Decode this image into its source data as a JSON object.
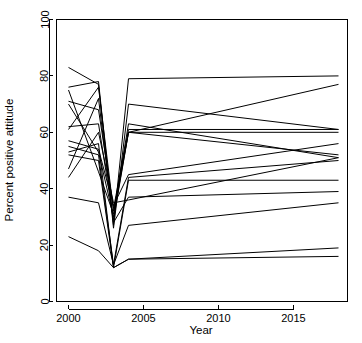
{
  "chart_data": {
    "type": "line",
    "title": "",
    "subtitle": "",
    "xlabel": "Year",
    "ylabel": "Percent positive attitude",
    "xlim": [
      1999.2,
      2018.6
    ],
    "ylim": [
      0,
      100
    ],
    "grid": false,
    "legend": false,
    "legend_position": "none",
    "line_color": "#000000",
    "background_color": "#ffffff",
    "xticks": [
      2000,
      2005,
      2010,
      2015
    ],
    "xtick_labels": [
      "2000",
      "2005",
      "2010",
      "2015"
    ],
    "yticks": [
      0,
      20,
      40,
      60,
      80,
      100
    ],
    "ytick_labels": [
      "0",
      "20",
      "40",
      "60",
      "80",
      "100"
    ],
    "x": [
      2000,
      2002,
      2003,
      2004,
      2018
    ],
    "series": [
      {
        "name": "series-1",
        "x": [
          2000,
          2002,
          2003,
          2004,
          2018
        ],
        "values": [
          83,
          77,
          26,
          70,
          61
        ]
      },
      {
        "name": "series-2",
        "x": [
          2000,
          2002,
          2003,
          2004,
          2018
        ],
        "values": [
          76,
          78,
          27,
          79,
          80
        ]
      },
      {
        "name": "series-3",
        "x": [
          2000,
          2002,
          2003,
          2004,
          2018
        ],
        "values": [
          75,
          46,
          31,
          63,
          51
        ]
      },
      {
        "name": "series-4",
        "x": [
          2000,
          2002,
          2003,
          2004,
          2018
        ],
        "values": [
          71,
          68,
          33,
          61,
          61
        ]
      },
      {
        "name": "series-5",
        "x": [
          2000,
          2002,
          2003,
          2004,
          2018
        ],
        "values": [
          70,
          53,
          30,
          60,
          60
        ]
      },
      {
        "name": "series-6",
        "x": [
          2000,
          2002,
          2003,
          2004,
          2018
        ],
        "values": [
          62,
          63,
          29,
          60,
          77
        ]
      },
      {
        "name": "series-7",
        "x": [
          2000,
          2002,
          2003,
          2004,
          2018
        ],
        "values": [
          61,
          76,
          32,
          60,
          52
        ]
      },
      {
        "name": "series-8",
        "x": [
          2000,
          2002,
          2003,
          2004,
          2018
        ],
        "values": [
          57,
          54,
          34,
          45,
          56
        ]
      },
      {
        "name": "series-9",
        "x": [
          2000,
          2002,
          2003,
          2004,
          2018
        ],
        "values": [
          55,
          52,
          13,
          44,
          50
        ]
      },
      {
        "name": "series-10",
        "x": [
          2000,
          2002,
          2003,
          2004,
          2018
        ],
        "values": [
          53,
          56,
          12,
          43,
          43
        ]
      },
      {
        "name": "series-11",
        "x": [
          2000,
          2002,
          2003,
          2004,
          2018
        ],
        "values": [
          47,
          72,
          28,
          37,
          39
        ]
      },
      {
        "name": "series-12",
        "x": [
          2000,
          2002,
          2003,
          2004,
          2018
        ],
        "values": [
          44,
          60,
          35,
          36,
          51
        ]
      },
      {
        "name": "series-13",
        "x": [
          2000,
          2002,
          2003,
          2004,
          2018
        ],
        "values": [
          37,
          35,
          13,
          27,
          35
        ]
      },
      {
        "name": "series-14",
        "x": [
          2000,
          2002,
          2003,
          2004,
          2018
        ],
        "values": [
          23,
          18,
          12,
          15,
          19
        ]
      },
      {
        "name": "series-15",
        "x": [
          2000,
          2002,
          2003,
          2004,
          2018
        ],
        "values": [
          52,
          50,
          12,
          15,
          16
        ]
      }
    ]
  },
  "axes": {
    "x_title": "Year",
    "y_title": "Percent positive attitude"
  }
}
